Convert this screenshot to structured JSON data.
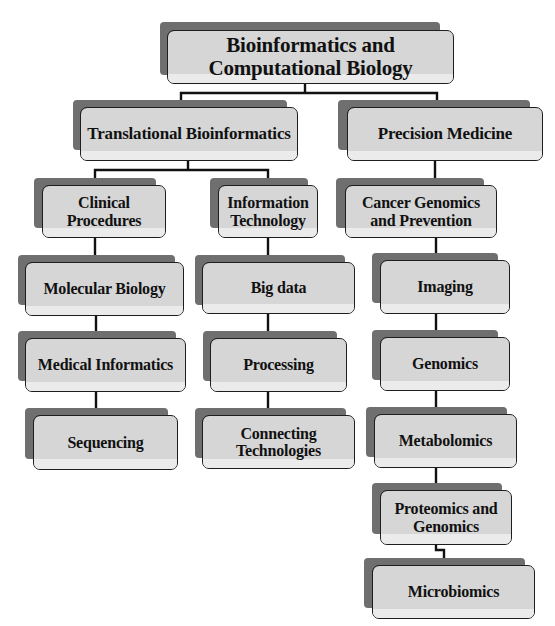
{
  "diagram": {
    "type": "hierarchy-tree",
    "colors": {
      "box_fill": "#d6d6d6",
      "box_border": "#1e1e1e",
      "shadow": "#6f6f6f",
      "connector": "#111111",
      "background": "#ffffff"
    },
    "nodes": {
      "root": {
        "label": "Bioinformatics and Computational Biology",
        "line1": "Bioinformatics and",
        "line2": "Computational Biology"
      },
      "translational": {
        "label": "Translational Bioinformatics",
        "parent": "root"
      },
      "precision": {
        "label": "Precision Medicine",
        "parent": "root"
      },
      "clinical": {
        "label": "Clinical Procedures",
        "line1": "Clinical",
        "line2": "Procedures",
        "parent": "translational"
      },
      "infotech": {
        "label": "Information Technology",
        "line1": "Information",
        "line2": "Technology",
        "parent": "translational"
      },
      "cancer": {
        "label": "Cancer Genomics and Prevention",
        "line1": "Cancer Genomics",
        "line2": "and Prevention",
        "parent": "precision"
      },
      "molecular": {
        "label": "Molecular Biology",
        "parent": "clinical"
      },
      "medical": {
        "label": "Medical Informatics",
        "parent": "molecular"
      },
      "sequencing": {
        "label": "Sequencing",
        "parent": "medical"
      },
      "bigdata": {
        "label": "Big data",
        "parent": "infotech"
      },
      "processing": {
        "label": "Processing",
        "parent": "bigdata"
      },
      "connecting": {
        "label": "Connecting Technologies",
        "line1": "Connecting",
        "line2": "Technologies",
        "parent": "processing"
      },
      "imaging": {
        "label": "Imaging",
        "parent": "cancer"
      },
      "genomics": {
        "label": "Genomics",
        "parent": "imaging"
      },
      "metabolomics": {
        "label": "Metabolomics",
        "parent": "genomics"
      },
      "proteomics": {
        "label": "Proteomics and Genomics",
        "line1": "Proteomics and",
        "line2": "Genomics",
        "parent": "metabolomics"
      },
      "microbiomics": {
        "label": "Microbiomics",
        "parent": "proteomics"
      }
    }
  }
}
